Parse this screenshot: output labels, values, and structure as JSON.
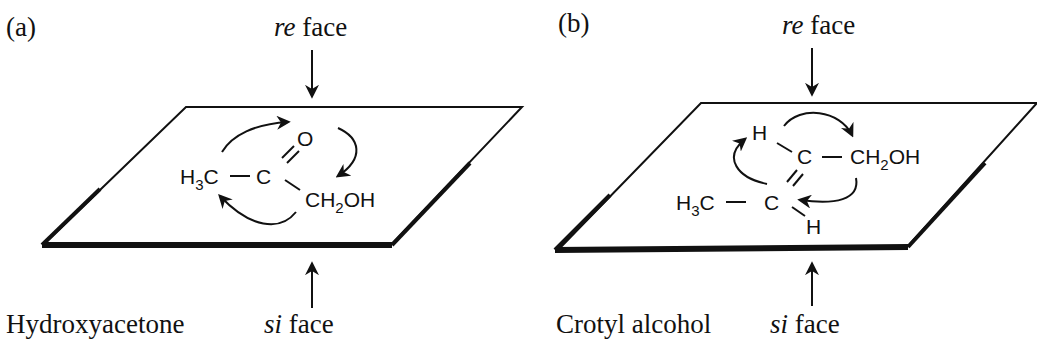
{
  "panels": [
    {
      "label": "(a)",
      "top_face": {
        "italic": "re",
        "text": " face"
      },
      "bottom_face": {
        "italic": "si",
        "text": " face"
      },
      "molecule_name": "Hydroxyacetone",
      "atoms": {
        "methyl": {
          "main": "H",
          "sub": "3",
          "tail": "C"
        },
        "carbonyl_c": "C",
        "oxygen": "O",
        "hydroxymethyl": {
          "main": "CH",
          "sub": "2",
          "tail": "OH"
        }
      }
    },
    {
      "label": "(b)",
      "top_face": {
        "italic": "re",
        "text": " face"
      },
      "bottom_face": {
        "italic": "si",
        "text": " face"
      },
      "molecule_name": "Crotyl alcohol",
      "atoms": {
        "h_top": "H",
        "c_upper": "C",
        "hydroxymethyl": {
          "main": "CH",
          "sub": "2",
          "tail": "OH"
        },
        "methyl": {
          "main": "H",
          "sub": "3",
          "tail": "C"
        },
        "c_lower": "C",
        "h_bottom": "H"
      }
    }
  ]
}
